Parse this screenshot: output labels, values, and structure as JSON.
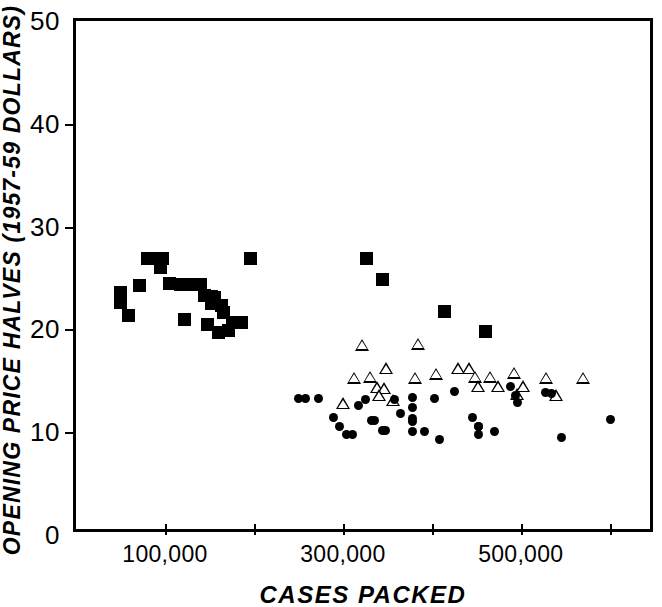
{
  "figure": {
    "background": "#ffffff",
    "ink_color": "#000000"
  },
  "axes": {
    "y_label": "OPENING PRICE HALVES (1957-59 DOLLARS)",
    "x_label": "CASES PACKED",
    "y_ticks": [
      {
        "value": 0,
        "label": "0"
      },
      {
        "value": 10,
        "label": "10"
      },
      {
        "value": 20,
        "label": "20"
      },
      {
        "value": 30,
        "label": "30"
      },
      {
        "value": 40,
        "label": "40"
      },
      {
        "value": 50,
        "label": "50"
      }
    ],
    "x_ticks": [
      {
        "value": 100000,
        "label": "100,000"
      },
      {
        "value": 200000,
        "label": ""
      },
      {
        "value": 300000,
        "label": "300,000"
      },
      {
        "value": 400000,
        "label": ""
      },
      {
        "value": 500000,
        "label": "500,000"
      },
      {
        "value": 600000,
        "label": ""
      }
    ]
  },
  "chart_data": {
    "type": "scatter",
    "title": "",
    "xlabel": "CASES PACKED",
    "ylabel": "OPENING PRICE HALVES (1957-59 DOLLARS)",
    "xlim": [
      0,
      652000
    ],
    "ylim": [
      0,
      50
    ],
    "grid": false,
    "legend": "none",
    "series": [
      {
        "name": "filled-square",
        "marker": "square",
        "fill": "#000000",
        "points": [
          [
            50000,
            23.6
          ],
          [
            50000,
            22.6
          ],
          [
            59000,
            21.4
          ],
          [
            71000,
            24.3
          ],
          [
            80000,
            26.9
          ],
          [
            88000,
            26.9
          ],
          [
            95000,
            26.0
          ],
          [
            97000,
            26.9
          ],
          [
            105000,
            24.5
          ],
          [
            118000,
            24.4
          ],
          [
            122000,
            21.0
          ],
          [
            131000,
            24.4
          ],
          [
            140000,
            24.4
          ],
          [
            145000,
            23.3
          ],
          [
            152000,
            23.2
          ],
          [
            156000,
            23.1
          ],
          [
            152000,
            22.5
          ],
          [
            148000,
            20.5
          ],
          [
            163000,
            22.3
          ],
          [
            166000,
            21.6
          ],
          [
            160000,
            19.7
          ],
          [
            171000,
            19.9
          ],
          [
            176000,
            20.7
          ],
          [
            186000,
            20.7
          ],
          [
            196000,
            26.9
          ],
          [
            326000,
            26.9
          ],
          [
            345000,
            24.9
          ],
          [
            414000,
            21.7
          ],
          [
            460000,
            19.8
          ]
        ]
      },
      {
        "name": "open-triangle",
        "marker": "triangle",
        "fill": "none",
        "points": [
          [
            300000,
            12.8
          ],
          [
            312000,
            15.3
          ],
          [
            322000,
            18.5
          ],
          [
            330000,
            15.4
          ],
          [
            338000,
            14.4
          ],
          [
            346000,
            14.3
          ],
          [
            341000,
            13.6
          ],
          [
            348000,
            16.2
          ],
          [
            356000,
            13.1
          ],
          [
            385000,
            18.6
          ],
          [
            381000,
            15.3
          ],
          [
            405000,
            15.7
          ],
          [
            429000,
            16.2
          ],
          [
            442000,
            16.2
          ],
          [
            448000,
            15.4
          ],
          [
            452000,
            14.5
          ],
          [
            465000,
            15.4
          ],
          [
            474000,
            14.5
          ],
          [
            492000,
            15.8
          ],
          [
            496000,
            13.7
          ],
          [
            503000,
            14.5
          ],
          [
            528000,
            15.3
          ],
          [
            540000,
            13.6
          ],
          [
            570000,
            15.3
          ]
        ]
      },
      {
        "name": "filled-circle",
        "marker": "circle",
        "fill": "#000000",
        "points": [
          [
            250000,
            13.3
          ],
          [
            258000,
            13.3
          ],
          [
            273000,
            13.3
          ],
          [
            290000,
            11.4
          ],
          [
            296000,
            10.6
          ],
          [
            304000,
            9.8
          ],
          [
            311000,
            9.8
          ],
          [
            318000,
            12.6
          ],
          [
            325000,
            13.2
          ],
          [
            332000,
            11.1
          ],
          [
            336000,
            11.1
          ],
          [
            344000,
            10.2
          ],
          [
            348000,
            10.2
          ],
          [
            358000,
            13.2
          ],
          [
            365000,
            11.8
          ],
          [
            378000,
            13.4
          ],
          [
            378000,
            12.4
          ],
          [
            378000,
            11.3
          ],
          [
            378000,
            11.0
          ],
          [
            378000,
            10.1
          ],
          [
            392000,
            10.1
          ],
          [
            403000,
            13.3
          ],
          [
            409000,
            9.3
          ],
          [
            425000,
            14.0
          ],
          [
            446000,
            11.4
          ],
          [
            452000,
            10.6
          ],
          [
            452000,
            10.6
          ],
          [
            452000,
            9.8
          ],
          [
            471000,
            10.1
          ],
          [
            488000,
            14.4
          ],
          [
            494000,
            13.6
          ],
          [
            496000,
            12.9
          ],
          [
            528000,
            13.9
          ],
          [
            534000,
            13.8
          ],
          [
            546000,
            9.5
          ],
          [
            601000,
            11.2
          ]
        ]
      }
    ]
  }
}
